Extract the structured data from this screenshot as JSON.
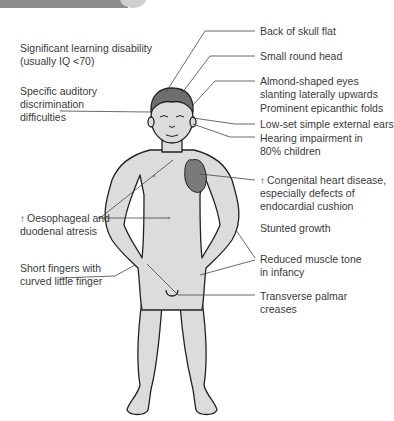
{
  "header": {
    "bar_color": "#8c8c8c",
    "cap_color": "#cfcfcf"
  },
  "figure": {
    "skin_color": "#dcdcdc",
    "hair_color": "#6e6e6e",
    "heart_color": "#7a7a7a",
    "outline_color": "#222222"
  },
  "labels_left": [
    {
      "lines": [
        "Significant learning disability",
        "(usually IQ <70)"
      ]
    },
    {
      "lines": [
        "Specific auditory",
        "discrimination",
        "difficulties"
      ]
    },
    {
      "arrow": "↑",
      "lines": [
        "Oesophageal and",
        "duodenal atresis"
      ]
    },
    {
      "lines": [
        "Short fingers with",
        "curved little finger"
      ]
    }
  ],
  "labels_right": [
    {
      "lines": [
        "Back of skull flat"
      ]
    },
    {
      "lines": [
        "Small round head"
      ]
    },
    {
      "lines": [
        "Almond-shaped eyes",
        "slanting laterally upwards"
      ]
    },
    {
      "lines": [
        "Prominent epicanthic folds"
      ]
    },
    {
      "lines": [
        "Low-set simple external ears"
      ]
    },
    {
      "lines": [
        "Hearing impairment in",
        "80% children"
      ]
    },
    {
      "arrow": "↑",
      "lines": [
        "Congenital heart disease,",
        "especially defects of",
        "endocardial cushion"
      ]
    },
    {
      "lines": [
        "Stunted growth"
      ]
    },
    {
      "lines": [
        "Reduced muscle tone",
        "in infancy"
      ]
    },
    {
      "lines": [
        "Transverse palmar",
        "creases"
      ]
    }
  ]
}
